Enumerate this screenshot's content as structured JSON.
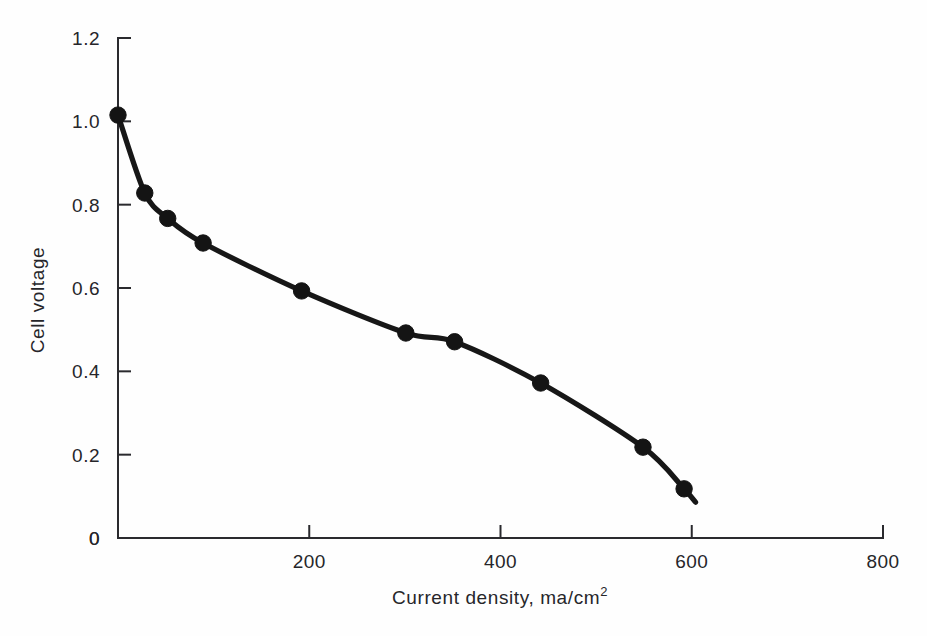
{
  "chart_data": {
    "type": "line",
    "title": "",
    "xlabel": "Current density, ma/cm2",
    "xlabel_base": "Current density, ma/cm",
    "xlabel_exponent": "2",
    "ylabel": "Cell voltage",
    "xlim": [
      0,
      800
    ],
    "ylim": [
      0,
      1.2
    ],
    "grid": false,
    "legend": "none",
    "xticks": [
      0,
      200,
      400,
      600,
      800
    ],
    "xtick_labels": [
      "0",
      "200",
      "400",
      "600",
      "800"
    ],
    "yticks": [
      0,
      0.2,
      0.4,
      0.6,
      0.8,
      1.0,
      1.2
    ],
    "ytick_labels": [
      "0",
      "0.2",
      "0.4",
      "0.6",
      "0.8",
      "1.0",
      "1.2"
    ],
    "series": [
      {
        "name": "Cell polarization curve",
        "marker": "filled-circle",
        "line_color": "#171717",
        "x": [
          0,
          28,
          52,
          89,
          192,
          301,
          352,
          442,
          549,
          592
        ],
        "y": [
          1.015,
          0.828,
          0.767,
          0.708,
          0.593,
          0.492,
          0.471,
          0.372,
          0.218,
          0.118
        ]
      }
    ],
    "curve_end": {
      "x": 604,
      "y": 0.086
    }
  },
  "figure": {
    "background_color": "#fefefe",
    "ink_color": "#1a1a1a",
    "axis_color": "#2a2a2e"
  }
}
